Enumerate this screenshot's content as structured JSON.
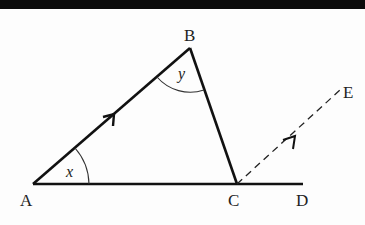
{
  "diagram": {
    "title": "",
    "points": {
      "A": {
        "label": "A",
        "x": 33,
        "y": 184
      },
      "B": {
        "label": "B",
        "x": 190,
        "y": 48
      },
      "C": {
        "label": "C",
        "x": 237,
        "y": 184
      },
      "D": {
        "label": "D",
        "x": 303,
        "y": 184
      },
      "E": {
        "label": "E",
        "x": 340,
        "y": 88
      }
    },
    "angles": {
      "at_A": {
        "label": "x"
      },
      "at_B": {
        "label": "y"
      }
    },
    "segments": [
      {
        "from": "A",
        "to": "B",
        "style": "solid",
        "arrow": true
      },
      {
        "from": "B",
        "to": "C",
        "style": "solid",
        "arrow": false
      },
      {
        "from": "A",
        "to": "D",
        "style": "solid",
        "arrow": false
      },
      {
        "from": "C",
        "to": "E",
        "style": "dashed",
        "arrow": true
      }
    ],
    "colors": {
      "stroke": "#111111",
      "background": "#fdfdfd",
      "topbar": "#0b0b0b"
    }
  }
}
